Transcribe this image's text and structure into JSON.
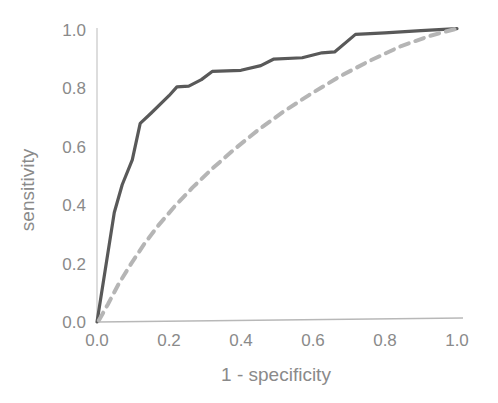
{
  "chart_data": {
    "type": "line",
    "title": "",
    "xlabel": "1 - specificity",
    "ylabel": "sensitivity",
    "xlim": [
      0.0,
      1.0
    ],
    "ylim": [
      0.0,
      1.0
    ],
    "xticks": [
      "0.0",
      "0.2",
      "0.4",
      "0.6",
      "0.8",
      "1.0"
    ],
    "xtick_values": [
      0.0,
      0.2,
      0.4,
      0.6,
      0.8,
      1.0
    ],
    "yticks": [
      "0.0",
      "0.2",
      "0.4",
      "0.6",
      "0.8",
      "1.0"
    ],
    "ytick_values": [
      0.0,
      0.2,
      0.4,
      0.6,
      0.8,
      1.0
    ],
    "grid": false,
    "legend": "none",
    "series": [
      {
        "name": "roc-curve-solid",
        "style": "solid",
        "color": "#595959",
        "width": 3.2,
        "points": [
          [
            0.0,
            0.0
          ],
          [
            0.048,
            0.375
          ],
          [
            0.07,
            0.47
          ],
          [
            0.098,
            0.555
          ],
          [
            0.12,
            0.68
          ],
          [
            0.15,
            0.715
          ],
          [
            0.2,
            0.775
          ],
          [
            0.222,
            0.805
          ],
          [
            0.255,
            0.808
          ],
          [
            0.29,
            0.83
          ],
          [
            0.32,
            0.858
          ],
          [
            0.4,
            0.862
          ],
          [
            0.455,
            0.878
          ],
          [
            0.49,
            0.9
          ],
          [
            0.57,
            0.905
          ],
          [
            0.625,
            0.922
          ],
          [
            0.66,
            0.925
          ],
          [
            0.718,
            0.985
          ],
          [
            0.8,
            0.99
          ],
          [
            0.9,
            0.998
          ],
          [
            1.0,
            1.005
          ]
        ]
      },
      {
        "name": "reference-curve-dashed",
        "style": "dashed",
        "color": "#b5b5b5",
        "width": 4.0,
        "dasharray": "9 7",
        "points": [
          [
            0.005,
            0.005
          ],
          [
            0.03,
            0.06
          ],
          [
            0.06,
            0.13
          ],
          [
            0.095,
            0.2
          ],
          [
            0.13,
            0.265
          ],
          [
            0.17,
            0.33
          ],
          [
            0.215,
            0.395
          ],
          [
            0.265,
            0.46
          ],
          [
            0.32,
            0.525
          ],
          [
            0.38,
            0.59
          ],
          [
            0.445,
            0.655
          ],
          [
            0.515,
            0.718
          ],
          [
            0.59,
            0.778
          ],
          [
            0.67,
            0.838
          ],
          [
            0.755,
            0.893
          ],
          [
            0.845,
            0.945
          ],
          [
            0.925,
            0.98
          ],
          [
            1.0,
            1.005
          ]
        ]
      }
    ]
  },
  "axes": {
    "x_axis_color": "#b8b8b8",
    "y_axis_color": "#cfcfcf",
    "background": "#ffffff"
  }
}
